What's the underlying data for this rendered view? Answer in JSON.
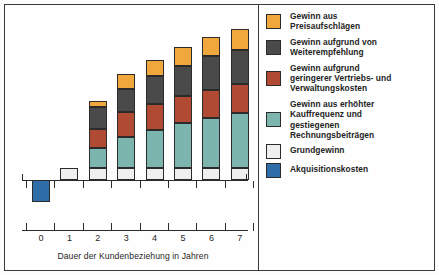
{
  "chart_data": {
    "type": "bar",
    "subtype": "stacked-bar",
    "title": "",
    "xlabel": "Dauer der Kundenbeziehung in Jahren",
    "ylabel": "",
    "grid": false,
    "legend_position": "right",
    "categories": [
      "0",
      "1",
      "2",
      "3",
      "4",
      "5",
      "6",
      "7"
    ],
    "baseline_value": 0,
    "units": "Gewinn (relative Einheiten)",
    "series": [
      {
        "name": "Akquisitionskosten",
        "color": "#2E6DA8",
        "values": [
          -25,
          0,
          0,
          0,
          0,
          0,
          0,
          0
        ]
      },
      {
        "name": "Grundgewinn",
        "color": "#EFEFEF",
        "values": [
          0,
          14,
          14,
          14,
          14,
          14,
          14,
          14
        ]
      },
      {
        "name": "Gewinn aus erhöhter Kauffrequenz und gestiegenen Rechnungsbeiträgen",
        "color": "#7CB5AD",
        "values": [
          0,
          0,
          22,
          35,
          42,
          50,
          56,
          62
        ]
      },
      {
        "name": "Gewinn aufgrund geringerer Vertriebs- und Verwaltungskosten",
        "color": "#B04A32",
        "values": [
          0,
          0,
          22,
          28,
          30,
          31,
          32,
          33
        ]
      },
      {
        "name": "Gewinn aufgrund von Weiterempfehlung",
        "color": "#4A4A4A",
        "values": [
          0,
          0,
          24,
          26,
          31,
          34,
          38,
          38
        ]
      },
      {
        "name": "Gewinn aus Preisaufschlägen",
        "color": "#F0A73C",
        "values": [
          0,
          0,
          7,
          17,
          19,
          21,
          22,
          24
        ]
      }
    ],
    "totals_above_axis": [
      0,
      14,
      89,
      120,
      136,
      150,
      162,
      171
    ]
  },
  "axis": {
    "tick_labels": [
      "0",
      "1",
      "2",
      "3",
      "4",
      "5",
      "6",
      "7"
    ],
    "title": "Dauer der Kundenbeziehung in Jahren"
  },
  "legend": {
    "items": [
      {
        "label": "Gewinn aus\nPreisaufschlägen",
        "color": "#F0A73C",
        "name": "preisaufschlaege"
      },
      {
        "label": "Gewinn aufgrund von\nWeiterempfehlung",
        "color": "#4A4A4A",
        "name": "weiterempfehlung"
      },
      {
        "label": "Gewinn aufgrund\ngeringerer Vertriebs- und\nVerwaltungskosten",
        "color": "#B04A32",
        "name": "vertriebskosten"
      },
      {
        "label": "Gewinn aus erhöhter\nKauffrequenz und\ngestiegenen\nRechnungsbeiträgen",
        "color": "#7CB5AD",
        "name": "kauffrequenz"
      },
      {
        "label": "Grundgewinn",
        "color": "#EFEFEF",
        "name": "grundgewinn"
      },
      {
        "label": "Akquisitionskosten",
        "color": "#2E6DA8",
        "name": "akquisitionskosten"
      }
    ]
  }
}
